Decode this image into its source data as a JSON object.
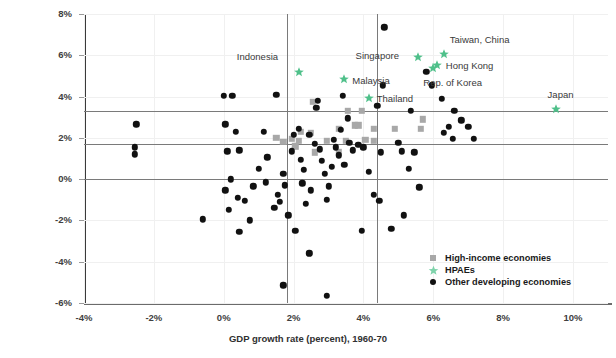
{
  "chart_data": {
    "type": "scatter",
    "title": "",
    "xlabel": "GDP growth rate (percent), 1960-70",
    "ylabel": "",
    "xlim": [
      -4,
      11
    ],
    "ylim": [
      -6,
      8
    ],
    "xticks": [
      "-4%",
      "-2%",
      "0%",
      "2%",
      "4%",
      "6%",
      "8%",
      "10%"
    ],
    "xtick_values": [
      -4,
      -2,
      0,
      2,
      4,
      6,
      8,
      10
    ],
    "yticks": [
      "8%",
      "6%",
      "4%",
      "2%",
      "0%",
      "-2%",
      "-4%",
      "-6%"
    ],
    "ytick_values": [
      8,
      6,
      4,
      2,
      0,
      -2,
      -4,
      -6
    ],
    "grid": true,
    "legend_position": "bottom-right",
    "reference_lines": {
      "horizontal": [
        3.3,
        1.7,
        0.0
      ],
      "vertical": [
        1.8,
        4.4
      ]
    },
    "series": [
      {
        "name": "High-income economies",
        "marker": "square",
        "color": "#a8a8a8",
        "points": [
          [
            2.55,
            3.75
          ],
          [
            3.55,
            3.3
          ],
          [
            3.95,
            3.3
          ],
          [
            3.3,
            2.45
          ],
          [
            3.75,
            2.6
          ],
          [
            4.3,
            2.45
          ],
          [
            4.9,
            2.45
          ],
          [
            5.65,
            2.45
          ],
          [
            5.7,
            2.9
          ],
          [
            2.2,
            2.3
          ],
          [
            2.5,
            2.25
          ],
          [
            1.95,
            1.95
          ],
          [
            2.15,
            1.85
          ],
          [
            1.7,
            1.8
          ],
          [
            2.95,
            1.85
          ],
          [
            3.5,
            1.85
          ],
          [
            4.3,
            1.85
          ],
          [
            2.6,
            1.3
          ],
          [
            3.3,
            1.3
          ],
          [
            2.05,
            1.6
          ],
          [
            3.85,
            2.6
          ],
          [
            1.5,
            2.0
          ],
          [
            4.05,
            1.9
          ]
        ]
      },
      {
        "name": "HPAEs",
        "marker": "star",
        "color": "#4fc08a",
        "points": [
          [
            2.15,
            5.2
          ],
          [
            3.45,
            4.85
          ],
          [
            4.15,
            3.95
          ],
          [
            5.55,
            5.9
          ],
          [
            6.3,
            6.05
          ],
          [
            6.1,
            5.55
          ],
          [
            6.0,
            5.4
          ],
          [
            9.5,
            3.4
          ]
        ],
        "labels": [
          {
            "name": "Indonesia",
            "x": 2.15,
            "y": 5.2,
            "dx": -62,
            "dy": -15
          },
          {
            "name": "Malaysia",
            "x": 3.45,
            "y": 4.85,
            "dx": 8,
            "dy": 2
          },
          {
            "name": "Thailand",
            "x": 4.15,
            "y": 3.95,
            "dx": 8,
            "dy": 1
          },
          {
            "name": "Singapore",
            "x": 5.55,
            "y": 5.9,
            "dx": -62,
            "dy": -1
          },
          {
            "name": "Taiwan, China",
            "x": 6.3,
            "y": 6.05,
            "dx": 6,
            "dy": -14
          },
          {
            "name": "Hong Kong",
            "x": 6.1,
            "y": 5.55,
            "dx": 9,
            "dy": 1
          },
          {
            "name": "Rep. of Korea",
            "x": 6.0,
            "y": 5.4,
            "dx": -10,
            "dy": 15
          },
          {
            "name": "Japan",
            "x": 9.5,
            "y": 3.4,
            "dx": -8,
            "dy": -14
          }
        ]
      },
      {
        "name": "Other developing economies",
        "marker": "circle",
        "color": "#111111",
        "points": [
          [
            -2.5,
            2.65
          ],
          [
            -2.55,
            1.55
          ],
          [
            -2.55,
            1.2
          ],
          [
            -0.6,
            -1.95
          ],
          [
            0.0,
            4.05
          ],
          [
            0.25,
            4.05
          ],
          [
            0.05,
            2.65
          ],
          [
            0.35,
            2.3
          ],
          [
            0.1,
            1.35
          ],
          [
            0.45,
            1.4
          ],
          [
            0.2,
            0.0
          ],
          [
            0.05,
            -0.55
          ],
          [
            0.4,
            -0.9
          ],
          [
            0.15,
            -1.5
          ],
          [
            0.6,
            -1.05
          ],
          [
            0.75,
            -2.0
          ],
          [
            0.45,
            -2.55
          ],
          [
            1.25,
            1.05
          ],
          [
            1.2,
            -0.15
          ],
          [
            1.0,
            0.5
          ],
          [
            1.5,
            4.1
          ],
          [
            1.7,
            0.25
          ],
          [
            1.75,
            -0.3
          ],
          [
            1.55,
            -0.75
          ],
          [
            1.6,
            -1.1
          ],
          [
            1.45,
            -1.4
          ],
          [
            1.85,
            -1.75
          ],
          [
            1.7,
            -5.15
          ],
          [
            2.0,
            2.15
          ],
          [
            2.15,
            2.45
          ],
          [
            1.95,
            1.35
          ],
          [
            2.2,
            0.95
          ],
          [
            2.3,
            0.45
          ],
          [
            2.25,
            -0.2
          ],
          [
            2.5,
            -0.55
          ],
          [
            2.35,
            -1.2
          ],
          [
            2.05,
            -2.5
          ],
          [
            2.45,
            -3.6
          ],
          [
            2.6,
            1.7
          ],
          [
            2.75,
            1.45
          ],
          [
            2.8,
            0.9
          ],
          [
            2.9,
            0.25
          ],
          [
            3.0,
            -0.35
          ],
          [
            2.95,
            -1.0
          ],
          [
            3.15,
            1.9
          ],
          [
            3.2,
            1.55
          ],
          [
            3.3,
            1.15
          ],
          [
            3.1,
            0.6
          ],
          [
            2.7,
            3.8
          ],
          [
            2.65,
            3.45
          ],
          [
            3.4,
            4.05
          ],
          [
            3.55,
            2.95
          ],
          [
            3.6,
            1.75
          ],
          [
            3.7,
            1.4
          ],
          [
            3.45,
            0.7
          ],
          [
            3.85,
            1.65
          ],
          [
            4.0,
            1.55
          ],
          [
            4.15,
            0.35
          ],
          [
            4.3,
            -0.75
          ],
          [
            4.45,
            -1.05
          ],
          [
            4.5,
            1.3
          ],
          [
            4.6,
            7.35
          ],
          [
            5.0,
            1.75
          ],
          [
            5.1,
            1.35
          ],
          [
            5.35,
            3.3
          ],
          [
            5.45,
            1.3
          ],
          [
            5.3,
            0.5
          ],
          [
            5.6,
            -0.4
          ],
          [
            5.8,
            5.2
          ],
          [
            5.95,
            4.55
          ],
          [
            6.25,
            3.9
          ],
          [
            6.45,
            2.55
          ],
          [
            6.3,
            2.25
          ],
          [
            6.55,
            1.95
          ],
          [
            6.8,
            2.85
          ],
          [
            7.0,
            2.55
          ],
          [
            7.15,
            1.95
          ],
          [
            5.15,
            -1.75
          ],
          [
            4.8,
            -2.4
          ],
          [
            3.95,
            -2.5
          ],
          [
            4.4,
            3.55
          ],
          [
            4.55,
            4.55
          ],
          [
            2.95,
            -5.65
          ],
          [
            6.6,
            3.3
          ],
          [
            1.15,
            2.3
          ],
          [
            0.85,
            -0.35
          ],
          [
            2.45,
            2.15
          ],
          [
            3.35,
            2.4
          ]
        ]
      }
    ]
  },
  "legend": {
    "items": [
      {
        "label": "High-income economies",
        "marker": "square"
      },
      {
        "label": "HPAEs",
        "marker": "star"
      },
      {
        "label": "Other developing economies",
        "marker": "circle"
      }
    ]
  },
  "axis": {
    "x_title": "GDP growth rate (percent), 1960-70"
  }
}
